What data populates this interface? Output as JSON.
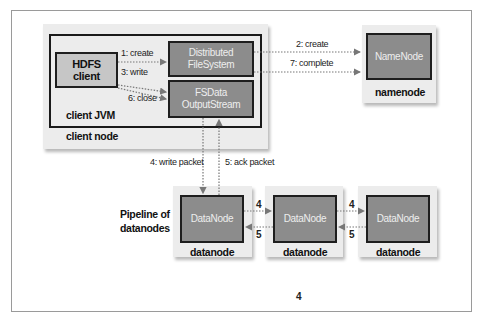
{
  "diagram": {
    "client_node": {
      "label": "client node",
      "jvm_label": "client JVM",
      "hdfs_client": {
        "line1": "HDFS",
        "line2": "client"
      },
      "distributed_fs": {
        "line1": "Distributed",
        "line2": "FileSystem"
      },
      "fsdata": {
        "line1": "FSData",
        "line2": "OutputStream"
      }
    },
    "namenode": {
      "box_label": "NameNode",
      "label": "namenode"
    },
    "pipeline_label": {
      "line1": "Pipeline of",
      "line2": "datanodes"
    },
    "datanodes": [
      {
        "box_label": "DataNode",
        "label": "datanode"
      },
      {
        "box_label": "DataNode",
        "label": "datanode"
      },
      {
        "box_label": "DataNode",
        "label": "datanode"
      }
    ],
    "arrows": {
      "create1": "1: create",
      "write3": "3: write",
      "close6": "6: close",
      "create2": "2: create",
      "complete7": "7: complete",
      "write_packet4": "4: write packet",
      "ack_packet5": "5: ack packet",
      "fwd_a": "4",
      "back_a": "5",
      "fwd_b": "4",
      "back_b": "5"
    },
    "page_number": "4"
  },
  "colors": {
    "component_fill": "#8c8c8c",
    "client_fill": "#c6c6c6",
    "node_shadow_fill": "#ececec",
    "border": "#1e1e1e",
    "arrow": "#777777"
  }
}
